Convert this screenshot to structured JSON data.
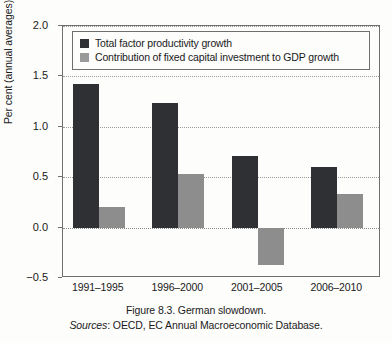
{
  "figure": {
    "caption_title": "Figure 8.3. German slowdown.",
    "caption_sources_word": "Sources",
    "caption_sources_rest": ": OECD, EC Annual Macroeconomic Database."
  },
  "colors": {
    "series_dark": "#2f3033",
    "series_light": "#8d8d8d",
    "axis": "#6f6f6f",
    "grid": "#9a9a9a",
    "background": "#fdfdfc"
  },
  "chart_data": {
    "type": "bar",
    "title": "Figure 8.3. German slowdown.",
    "xlabel": "",
    "ylabel": "Per cent (annual averages)",
    "categories": [
      "1991–1995",
      "1996–2000",
      "2001–2005",
      "2006–2010"
    ],
    "series": [
      {
        "name": "Total factor productivity growth",
        "color": "#2f3033",
        "values": [
          1.42,
          1.24,
          0.71,
          0.6
        ]
      },
      {
        "name": "Contribution of fixed capital investment to GDP growth",
        "color": "#8d8d8d",
        "values": [
          0.2,
          0.53,
          -0.37,
          0.33
        ]
      }
    ],
    "ylim": [
      -0.5,
      2.0
    ],
    "yticks": [
      "2.0",
      "1.5",
      "1.0",
      "0.5",
      "0.0",
      "−0.5"
    ],
    "ytick_values": [
      2.0,
      1.5,
      1.0,
      0.5,
      0.0,
      -0.5
    ],
    "grid": true,
    "grid_style": "dotted-horizontal",
    "legend_position": "top-left-inside"
  }
}
